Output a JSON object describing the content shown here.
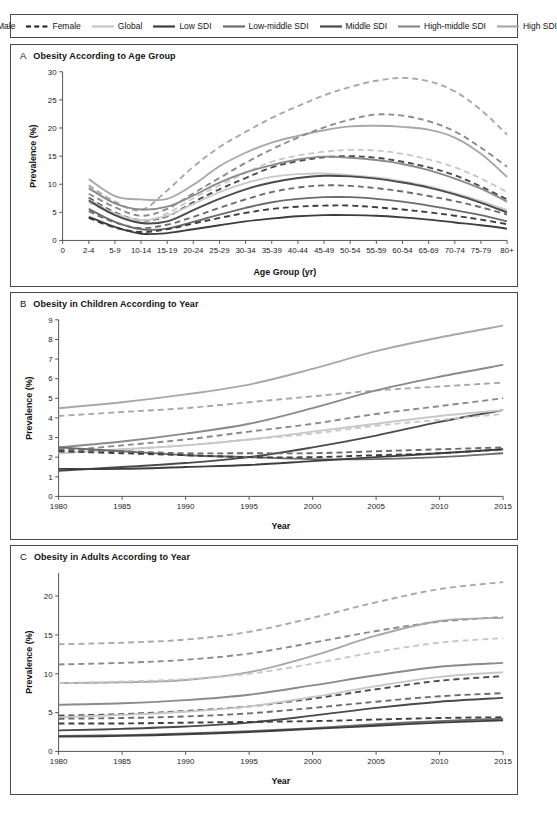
{
  "figure": {
    "title_panels": [
      "A",
      "B",
      "C"
    ]
  },
  "legend": {
    "position": "top",
    "items": [
      {
        "label": "Male",
        "style": "solid",
        "color": "#1a1a1a",
        "name": "legend-male"
      },
      {
        "label": "Female",
        "style": "dashed",
        "color": "#1a1a1a",
        "name": "legend-female"
      },
      {
        "label": "Global",
        "style": "solid",
        "color": "#c8c8c8",
        "name": "legend-global"
      },
      {
        "label": "Low SDI",
        "style": "solid",
        "color": "#3d3d3d",
        "name": "legend-low-sdi"
      },
      {
        "label": "Low-middle SDI",
        "style": "solid",
        "color": "#6b6b6b",
        "name": "legend-low-middle-sdi"
      },
      {
        "label": "Middle SDI",
        "style": "solid",
        "color": "#4a4a4a",
        "name": "legend-middle-sdi"
      },
      {
        "label": "High-middle SDI",
        "style": "solid",
        "color": "#8a8a8a",
        "name": "legend-high-middle-sdi"
      },
      {
        "label": "High SDI",
        "style": "solid",
        "color": "#a8a8a8",
        "name": "legend-high-sdi"
      }
    ]
  },
  "panels": [
    {
      "letter": "A",
      "title": "Obesity According to Age Group",
      "ylabel": "Prevalence (%)",
      "xlabel": "Age Group (yr)"
    },
    {
      "letter": "B",
      "title": "Obesity in Children According to Year",
      "ylabel": "Prevalence (%)",
      "xlabel": "Year"
    },
    {
      "letter": "C",
      "title": "Obesity in Adults According to Year",
      "ylabel": "Prevalence (%)",
      "xlabel": "Year"
    }
  ],
  "chart_data": [
    {
      "type": "line",
      "panel": "A",
      "title": "Obesity According to Age Group",
      "xlabel": "Age Group (yr)",
      "ylabel": "Prevalence (%)",
      "categories": [
        "0",
        "2-4",
        "5-9",
        "10-14",
        "15-19",
        "20-24",
        "25-29",
        "30-34",
        "35-39",
        "40-44",
        "45-49",
        "50-54",
        "55-59",
        "60-54",
        "65-69",
        "70-74",
        "75-79",
        "80+"
      ],
      "xticklabels": [
        "0",
        "2-4",
        "5-9",
        "10-14",
        "15-19",
        "20-24",
        "25-29",
        "30-34",
        "35-39",
        "40-44",
        "45-49",
        "50-54",
        "55-59",
        "60-54",
        "65-69",
        "70-74",
        "75-79",
        "80+"
      ],
      "yticks": [
        0,
        5,
        10,
        15,
        20,
        25,
        30
      ],
      "ylim": [
        0,
        30
      ],
      "grid": false,
      "series": [
        {
          "name": "High SDI Female",
          "sex": "Female",
          "sdi": "High SDI",
          "color": "#a8a8a8",
          "style": "dashed",
          "values": [
            null,
            9.8,
            6.9,
            5.4,
            8.9,
            13.1,
            16.6,
            19.3,
            21.8,
            23.9,
            25.8,
            27.3,
            28.4,
            28.9,
            28.3,
            26.5,
            23.2,
            18.8
          ]
        },
        {
          "name": "High SDI Male",
          "sex": "Male",
          "sdi": "High SDI",
          "color": "#a8a8a8",
          "style": "solid",
          "values": [
            null,
            10.9,
            7.9,
            7.3,
            7.4,
            9.9,
            13.2,
            15.6,
            17.4,
            18.6,
            19.6,
            20.3,
            20.4,
            20.2,
            19.7,
            18.3,
            15.4,
            11.3
          ]
        },
        {
          "name": "High-middle SDI Female",
          "sex": "Female",
          "sdi": "High-middle SDI",
          "color": "#8a8a8a",
          "style": "dashed",
          "values": [
            null,
            8.3,
            5.9,
            4.4,
            5.6,
            8.4,
            11.1,
            13.8,
            16.2,
            18.3,
            20.1,
            21.5,
            22.4,
            22.2,
            21.2,
            19.4,
            16.5,
            13.1
          ]
        },
        {
          "name": "Global Female",
          "sex": "Female",
          "sdi": "Global",
          "color": "#c8c8c8",
          "style": "dashed",
          "values": [
            null,
            6.8,
            4.6,
            3.3,
            4.8,
            7.5,
            9.8,
            12.0,
            14.0,
            15.1,
            15.8,
            16.1,
            16.0,
            15.4,
            14.4,
            13.0,
            11.0,
            8.6
          ]
        },
        {
          "name": "Middle SDI Female",
          "sex": "Female",
          "sdi": "Middle SDI",
          "color": "#4a4a4a",
          "style": "dashed",
          "values": [
            null,
            7.6,
            5.0,
            3.6,
            4.3,
            6.8,
            9.1,
            11.1,
            13.0,
            14.1,
            14.8,
            15.0,
            14.7,
            14.0,
            13.0,
            11.6,
            9.6,
            7.3
          ]
        },
        {
          "name": "High-middle SDI Male",
          "sex": "Male",
          "sdi": "High-middle SDI",
          "color": "#8a8a8a",
          "style": "solid",
          "values": [
            null,
            9.3,
            6.6,
            5.5,
            6.0,
            8.0,
            10.3,
            12.1,
            13.4,
            14.4,
            14.9,
            14.7,
            14.3,
            13.6,
            12.5,
            11.0,
            9.2,
            6.9
          ]
        },
        {
          "name": "Global Male",
          "sex": "Male",
          "sdi": "Global",
          "color": "#c8c8c8",
          "style": "solid",
          "values": [
            null,
            7.3,
            4.8,
            3.6,
            4.4,
            6.5,
            8.6,
            10.2,
            11.3,
            11.8,
            11.9,
            11.6,
            11.2,
            10.5,
            9.6,
            8.4,
            7.0,
            5.4
          ]
        },
        {
          "name": "Middle SDI Male",
          "sex": "Male",
          "sdi": "Middle SDI",
          "color": "#4a4a4a",
          "style": "solid",
          "values": [
            null,
            7.1,
            4.5,
            3.1,
            3.4,
            5.4,
            7.4,
            9.1,
            10.3,
            11.1,
            11.5,
            11.4,
            11.0,
            10.3,
            9.4,
            8.2,
            6.7,
            5.0
          ]
        },
        {
          "name": "Low-middle SDI Female",
          "sex": "Female",
          "sdi": "Low-middle SDI",
          "color": "#6b6b6b",
          "style": "dashed",
          "values": [
            null,
            5.2,
            3.2,
            2.2,
            2.8,
            4.2,
            5.8,
            7.3,
            8.6,
            9.4,
            9.8,
            9.7,
            9.3,
            8.7,
            7.9,
            7.0,
            5.9,
            4.6
          ]
        },
        {
          "name": "Low-middle SDI Male",
          "sex": "Male",
          "sdi": "Low-middle SDI",
          "color": "#6b6b6b",
          "style": "solid",
          "values": [
            null,
            5.6,
            3.3,
            2.0,
            2.1,
            3.3,
            4.6,
            5.8,
            6.8,
            7.4,
            7.7,
            7.7,
            7.4,
            6.9,
            6.2,
            5.4,
            4.5,
            3.4
          ]
        },
        {
          "name": "Low SDI Female",
          "sex": "Female",
          "sdi": "Low SDI",
          "color": "#3d3d3d",
          "style": "dashed",
          "values": [
            null,
            4.0,
            2.3,
            1.5,
            2.0,
            3.0,
            4.0,
            4.9,
            5.6,
            6.0,
            6.2,
            6.2,
            5.9,
            5.5,
            5.0,
            4.4,
            3.7,
            2.9
          ]
        },
        {
          "name": "Low SDI Male",
          "sex": "Male",
          "sdi": "Low SDI",
          "color": "#3d3d3d",
          "style": "solid",
          "values": [
            null,
            4.2,
            2.4,
            1.2,
            1.3,
            2.0,
            2.7,
            3.4,
            3.9,
            4.3,
            4.5,
            4.5,
            4.4,
            4.1,
            3.7,
            3.2,
            2.7,
            2.1
          ]
        }
      ]
    },
    {
      "type": "line",
      "panel": "B",
      "title": "Obesity in Children According to Year",
      "xlabel": "Year",
      "ylabel": "Prevalence (%)",
      "x": [
        1980,
        1985,
        1990,
        1995,
        2000,
        2005,
        2010,
        2015
      ],
      "xticks": [
        1980,
        1985,
        1990,
        1995,
        2000,
        2005,
        2010,
        2015
      ],
      "yticks": [
        0,
        1,
        2,
        3,
        4,
        5,
        6,
        7,
        8,
        9
      ],
      "ylim": [
        0,
        9
      ],
      "grid": false,
      "series": [
        {
          "name": "High SDI Male",
          "sex": "Male",
          "sdi": "High SDI",
          "color": "#a8a8a8",
          "style": "solid",
          "values": [
            4.5,
            4.8,
            5.2,
            5.7,
            6.5,
            7.4,
            8.1,
            8.7
          ]
        },
        {
          "name": "High SDI Female",
          "sex": "Female",
          "sdi": "High SDI",
          "color": "#a8a8a8",
          "style": "dashed",
          "values": [
            4.1,
            4.3,
            4.5,
            4.8,
            5.1,
            5.4,
            5.6,
            5.8
          ]
        },
        {
          "name": "High-middle SDI Male",
          "sex": "Male",
          "sdi": "High-middle SDI",
          "color": "#8a8a8a",
          "style": "solid",
          "values": [
            2.5,
            2.8,
            3.2,
            3.7,
            4.5,
            5.4,
            6.1,
            6.7
          ]
        },
        {
          "name": "High-middle SDI Female",
          "sex": "Female",
          "sdi": "High-middle SDI",
          "color": "#8a8a8a",
          "style": "dashed",
          "values": [
            2.3,
            2.6,
            2.9,
            3.3,
            3.7,
            4.2,
            4.6,
            5.0
          ]
        },
        {
          "name": "Middle SDI Male",
          "sex": "Male",
          "sdi": "Middle SDI",
          "color": "#4a4a4a",
          "style": "solid",
          "values": [
            1.3,
            1.5,
            1.7,
            2.0,
            2.5,
            3.1,
            3.8,
            4.4
          ]
        },
        {
          "name": "Global Male",
          "sex": "Male",
          "sdi": "Global",
          "color": "#c8c8c8",
          "style": "solid",
          "values": [
            2.2,
            2.4,
            2.6,
            2.9,
            3.3,
            3.7,
            4.1,
            4.4
          ]
        },
        {
          "name": "Global Female",
          "sex": "Female",
          "sdi": "Global",
          "color": "#c8c8c8",
          "style": "dashed",
          "values": [
            2.2,
            2.4,
            2.6,
            2.9,
            3.2,
            3.6,
            3.9,
            4.2
          ]
        },
        {
          "name": "Low-middle SDI Female",
          "sex": "Female",
          "sdi": "Low-middle SDI",
          "color": "#6b6b6b",
          "style": "dashed",
          "values": [
            2.4,
            2.3,
            2.2,
            2.2,
            2.2,
            2.3,
            2.4,
            2.5
          ]
        },
        {
          "name": "Low-middle SDI Male",
          "sex": "Male",
          "sdi": "Low-middle SDI",
          "color": "#6b6b6b",
          "style": "solid",
          "values": [
            2.5,
            2.3,
            2.1,
            2.0,
            1.9,
            1.9,
            2.0,
            2.2
          ]
        },
        {
          "name": "Low SDI Female",
          "sex": "Female",
          "sdi": "Low SDI",
          "color": "#3d3d3d",
          "style": "dashed",
          "values": [
            2.3,
            2.2,
            2.1,
            2.0,
            2.0,
            2.1,
            2.2,
            2.4
          ]
        },
        {
          "name": "Low SDI Male",
          "sex": "Male",
          "sdi": "Low SDI",
          "color": "#3d3d3d",
          "style": "solid",
          "values": [
            1.4,
            1.4,
            1.5,
            1.6,
            1.8,
            2.0,
            2.2,
            2.4
          ]
        }
      ]
    },
    {
      "type": "line",
      "panel": "C",
      "title": "Obesity in Adults According to Year",
      "xlabel": "Year",
      "ylabel": "Prevalence (%)",
      "x": [
        1980,
        1985,
        1990,
        1995,
        2000,
        2005,
        2010,
        2015
      ],
      "xticks": [
        1980,
        1985,
        1990,
        1995,
        2000,
        2005,
        2010,
        2015
      ],
      "yticks": [
        0,
        5,
        10,
        15,
        20
      ],
      "ylim": [
        0,
        23
      ],
      "grid": false,
      "series": [
        {
          "name": "High SDI Female",
          "sex": "Female",
          "sdi": "High SDI",
          "color": "#a8a8a8",
          "style": "dashed",
          "values": [
            13.8,
            14.0,
            14.4,
            15.4,
            17.2,
            19.2,
            20.9,
            21.8
          ]
        },
        {
          "name": "High-middle SDI Female",
          "sex": "Female",
          "sdi": "High-middle SDI",
          "color": "#8a8a8a",
          "style": "dashed",
          "values": [
            11.2,
            11.4,
            11.8,
            12.6,
            14.0,
            15.5,
            16.7,
            17.3
          ]
        },
        {
          "name": "High SDI Male",
          "sex": "Male",
          "sdi": "High SDI",
          "color": "#a8a8a8",
          "style": "solid",
          "values": [
            8.8,
            8.9,
            9.2,
            10.2,
            12.3,
            14.9,
            16.8,
            17.2
          ]
        },
        {
          "name": "Global Female",
          "sex": "Female",
          "sdi": "Global",
          "color": "#c8c8c8",
          "style": "dashed",
          "values": [
            8.8,
            9.0,
            9.3,
            10.0,
            11.3,
            12.8,
            14.0,
            14.6
          ]
        },
        {
          "name": "High-middle SDI Male",
          "sex": "Male",
          "sdi": "High-middle SDI",
          "color": "#8a8a8a",
          "style": "solid",
          "values": [
            6.0,
            6.2,
            6.6,
            7.3,
            8.5,
            9.8,
            10.9,
            11.4
          ]
        },
        {
          "name": "Middle SDI Female",
          "sex": "Female",
          "sdi": "Middle SDI",
          "color": "#4a4a4a",
          "style": "dashed",
          "values": [
            4.6,
            4.8,
            5.2,
            5.8,
            6.8,
            8.0,
            9.1,
            9.7
          ]
        },
        {
          "name": "Global Male",
          "sex": "Male",
          "sdi": "Global",
          "color": "#c8c8c8",
          "style": "solid",
          "values": [
            4.4,
            4.7,
            5.1,
            5.8,
            7.0,
            8.4,
            9.6,
            10.2
          ]
        },
        {
          "name": "Low-middle SDI Female",
          "sex": "Female",
          "sdi": "Low-middle SDI",
          "color": "#6b6b6b",
          "style": "dashed",
          "values": [
            4.2,
            4.3,
            4.5,
            4.9,
            5.6,
            6.4,
            7.1,
            7.5
          ]
        },
        {
          "name": "Middle SDI Male",
          "sex": "Male",
          "sdi": "Middle SDI",
          "color": "#4a4a4a",
          "style": "solid",
          "values": [
            2.7,
            2.9,
            3.2,
            3.7,
            4.6,
            5.6,
            6.4,
            6.9
          ]
        },
        {
          "name": "Low SDI Female",
          "sex": "Female",
          "sdi": "Low SDI",
          "color": "#3d3d3d",
          "style": "dashed",
          "values": [
            3.6,
            3.6,
            3.7,
            3.8,
            3.9,
            4.1,
            4.3,
            4.4
          ]
        },
        {
          "name": "Low-middle SDI Male",
          "sex": "Male",
          "sdi": "Low-middle SDI",
          "color": "#6b6b6b",
          "style": "solid",
          "values": [
            2.0,
            2.1,
            2.3,
            2.6,
            3.0,
            3.5,
            3.9,
            4.2
          ]
        },
        {
          "name": "Low SDI Male",
          "sex": "Male",
          "sdi": "Low SDI",
          "color": "#3d3d3d",
          "style": "solid",
          "values": [
            1.9,
            2.0,
            2.2,
            2.5,
            2.9,
            3.3,
            3.7,
            4.0
          ]
        }
      ]
    }
  ]
}
